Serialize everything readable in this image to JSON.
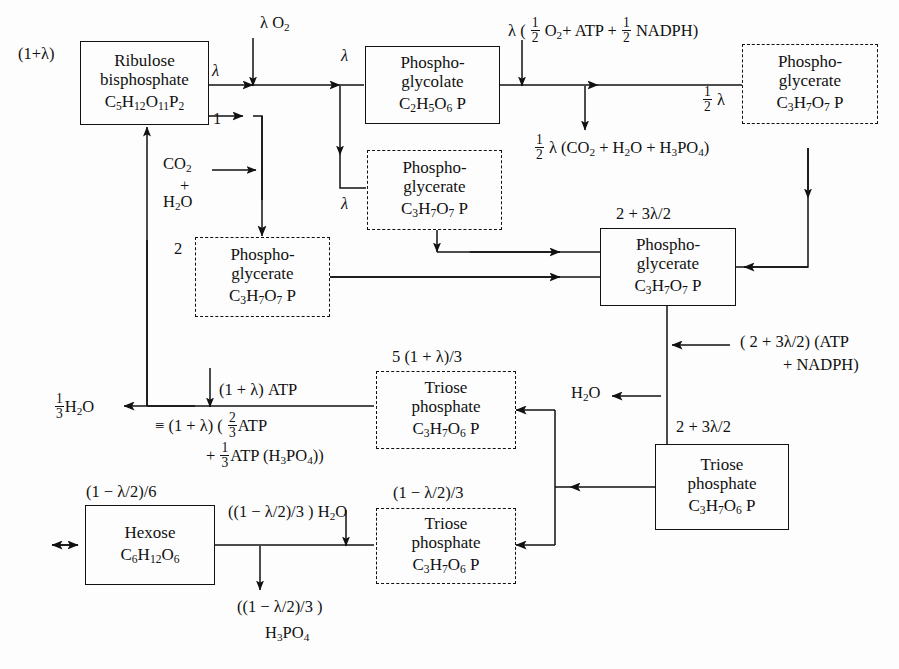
{
  "diagram": {
    "type": "flow-diagram",
    "symbols": {
      "lambda": "λ",
      "equiv": "≡"
    }
  },
  "boxes": {
    "ribulose": {
      "name": "Ribulose bisphosphate",
      "line1": "Ribulose",
      "line2": "bisphosphate",
      "formula_html": "C<sub>5</sub>H<sub>12</sub>O<sub>11</sub>P<sub>2</sub>",
      "style": "solid",
      "input_label": "(1+λ)"
    },
    "phosphoglycolate": {
      "line1": "Phospho-",
      "line2": "glycolate",
      "formula_html": "C<sub>2</sub>H<sub>5</sub>O<sub>6</sub> P",
      "style": "solid",
      "input_label": "λ"
    },
    "pg_topright": {
      "line1": "Phospho-",
      "line2": "glycerate",
      "formula_html": "C<sub>3</sub>H<sub>7</sub>O<sub>7</sub> P",
      "style": "dashed"
    },
    "pg_middle": {
      "line1": "Phospho-",
      "line2": "glycerate",
      "formula_html": "C<sub>3</sub>H<sub>7</sub>O<sub>7</sub> P",
      "style": "dashed",
      "input_label": "λ"
    },
    "pg_left": {
      "line1": "Phospho-",
      "line2": "glycerate",
      "formula_html": "C<sub>3</sub>H<sub>7</sub>O<sub>7</sub> P",
      "style": "dashed",
      "input_label": "2"
    },
    "pg_main": {
      "line1": "Phospho-",
      "line2": "glycerate",
      "formula_html": "C<sub>3</sub>H<sub>7</sub>O<sub>7</sub> P",
      "style": "solid",
      "input_label": "2 + 3λ/2"
    },
    "triose_upper": {
      "line1": "Triose",
      "line2": "phosphate",
      "formula_html": "C<sub>3</sub>H<sub>7</sub>O<sub>6</sub> P",
      "style": "dashed",
      "input_label": "5 (1 + λ)/3"
    },
    "triose_lower": {
      "line1": "Triose",
      "line2": "phosphate",
      "formula_html": "C<sub>3</sub>H<sub>7</sub>O<sub>6</sub> P",
      "style": "dashed",
      "input_label": "(1 − λ/2)/3"
    },
    "triose_right": {
      "line1": "Triose",
      "line2": "phosphate",
      "formula_html": "C<sub>3</sub>H<sub>7</sub>O<sub>6</sub> P",
      "style": "solid",
      "input_label": "2 + 3λ/2"
    },
    "hexose": {
      "line1": "Hexose",
      "line2": "",
      "formula_html": "C<sub>6</sub>H<sub>12</sub>O<sub>6</sub>",
      "style": "solid",
      "input_label": "(1 − λ/2)/6"
    }
  },
  "labels": {
    "ribulose_in": "(1+λ)",
    "lambda_out_top": "λ",
    "one_out": "1",
    "lambda_o2_html": "λ O<sub>2</sub>",
    "lambda_into_glycolate": "λ",
    "co2_html": "CO<sub>2</sub>",
    "plus": "+",
    "h2o_html": "H<sub>2</sub>O",
    "lambda_mid_return": "λ",
    "pg_left_count": "2",
    "oxygen_atp_nadph_html": "λ ( <span class=\"fr\"><span class=\"n\">1</span><span class=\"d\">2</span></span> O<sub>2</sub>+ ATP + <span class=\"fr\"><span class=\"n\">1</span><span class=\"d\">2</span></span> NADPH)",
    "half_lambda_products_html": "<span class=\"fr\"><span class=\"n\">1</span><span class=\"d\">2</span></span> λ (CO<sub>2</sub> + H<sub>2</sub>O + H<sub>3</sub>PO<sub>4</sub>)",
    "half_lambda_html": "<span class=\"fr\"><span class=\"n\">1</span><span class=\"d\">2</span></span> λ",
    "pg_main_in": "2 + 3λ/2",
    "atp_nadph_consumed": "( 2 + 3λ/2) (ATP",
    "atp_nadph_consumed_2": "+ NADPH)",
    "h2o_right_html": "H<sub>2</sub>O",
    "triose_right_in": "2 + 3λ/2",
    "triose_upper_in": "5 (1 + λ)/3",
    "triose_lower_in": "(1 − λ/2)/3",
    "one_third_h2o_html": "<span class=\"fr\"><span class=\"n\">1</span><span class=\"d\">3</span></span>H<sub>2</sub>O",
    "atp_in": "(1 + λ) ATP",
    "atp_equiv_1_html": "≡ (1 + λ) ( <span class=\"fr\"><span class=\"n\">2</span><span class=\"d\">3</span></span>ATP",
    "atp_equiv_2_html": "+ <span class=\"fr\"><span class=\"n\">1</span><span class=\"d\">3</span></span>ATP (H<sub>3</sub>PO<sub>4</sub>))",
    "hexose_in": "(1 − λ/2)/6",
    "hexose_h2o_html": "((1 − λ/2)/3 ) H<sub>2</sub>O",
    "h3po4_amount": "((1 − λ/2)/3 )",
    "h3po4_html": "H<sub>3</sub>PO<sub>4</sub>"
  }
}
